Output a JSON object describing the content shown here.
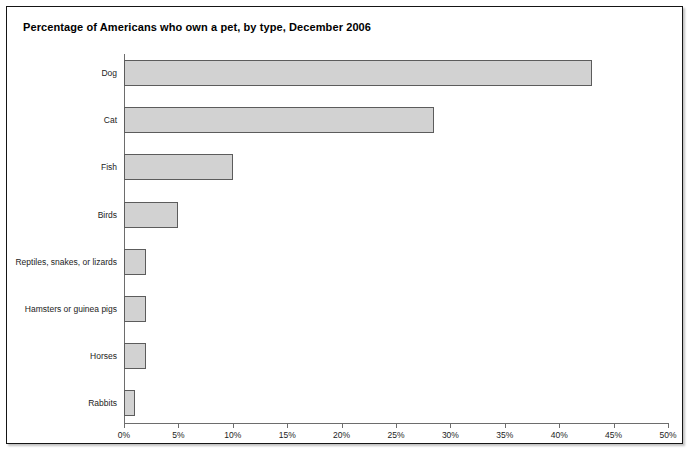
{
  "chart_data": {
    "type": "bar",
    "orientation": "horizontal",
    "title": "Percentage of Americans who own a pet, by type, December 2006",
    "xlabel": "",
    "ylabel": "",
    "xlim": [
      0,
      50
    ],
    "xtick_labels": [
      "0%",
      "5%",
      "10%",
      "15%",
      "20%",
      "25%",
      "30%",
      "35%",
      "40%",
      "45%",
      "50%"
    ],
    "xticks": [
      0,
      5,
      10,
      15,
      20,
      25,
      30,
      35,
      40,
      45,
      50
    ],
    "grid": false,
    "legend": false,
    "categories": [
      "Dog",
      "Cat",
      "Fish",
      "Birds",
      "Reptiles, snakes, or lizards",
      "Hamsters or guinea pigs",
      "Horses",
      "Rabbits"
    ],
    "values": [
      43,
      28.5,
      10,
      5,
      2,
      2,
      2,
      1
    ],
    "series": [
      {
        "name": "Percentage of Americans who own a pet",
        "values": [
          43,
          28.5,
          10,
          5,
          2,
          2,
          2,
          1
        ]
      }
    ],
    "colors": {
      "bar_fill": "#d2d2d2",
      "bar_border": "#5c5c5c",
      "axis": "#6d6d6d",
      "text": "#1c1c1c",
      "frame": "#151515",
      "background": "#ffffff"
    }
  }
}
